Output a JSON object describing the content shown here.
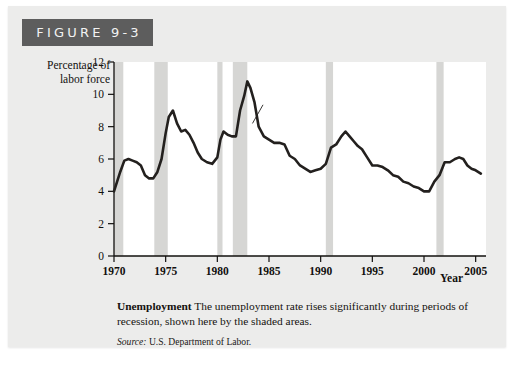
{
  "figure": {
    "badge_label": "FIGURE 9-3"
  },
  "caption": {
    "title": "Unemployment",
    "body": " The unemployment rate rises significantly during periods of recession, shown here by the shaded areas.",
    "source_label": "Source:",
    "source_text": " U.S. Department of Labor."
  },
  "axes": {
    "y_title": "Percentage of labor force",
    "x_title": "Year"
  },
  "annotation": {
    "series_label": "Unemployment rate"
  },
  "colors": {
    "badge_background": "#5d5d5d",
    "badge_text": "#f2f2f2",
    "page_background": "#ececeb",
    "plot_background": "#ffffff",
    "line": "#23201e",
    "recession_band": "#d6d6d4",
    "axis": "#12100e"
  },
  "chart_data": {
    "type": "line",
    "title": "Unemployment",
    "xlabel": "Year",
    "ylabel": "Percentage of labor force",
    "xlim": [
      1970,
      2006
    ],
    "ylim": [
      0,
      12
    ],
    "ytick_values": [
      0,
      2,
      4,
      6,
      8,
      10,
      12
    ],
    "xtick_values": [
      1970,
      1975,
      1980,
      1985,
      1990,
      1995,
      2000,
      2005
    ],
    "grid": false,
    "legend": "none",
    "series": [
      {
        "name": "Unemployment rate",
        "x": [
          1970.0,
          1970.3,
          1970.6,
          1971.0,
          1971.4,
          1971.8,
          1972.2,
          1972.6,
          1973.0,
          1973.4,
          1973.8,
          1974.2,
          1974.6,
          1975.0,
          1975.3,
          1975.7,
          1976.1,
          1976.5,
          1976.9,
          1977.3,
          1977.7,
          1978.1,
          1978.5,
          1979.0,
          1979.5,
          1980.0,
          1980.3,
          1980.6,
          1981.0,
          1981.4,
          1981.8,
          1982.2,
          1982.6,
          1982.9,
          1983.2,
          1983.6,
          1984.0,
          1984.5,
          1985.0,
          1985.5,
          1986.0,
          1986.5,
          1987.0,
          1987.5,
          1988.0,
          1988.5,
          1989.0,
          1989.5,
          1990.0,
          1990.5,
          1991.0,
          1991.5,
          1992.0,
          1992.4,
          1992.8,
          1993.2,
          1993.6,
          1994.0,
          1994.5,
          1995.0,
          1995.5,
          1996.0,
          1996.5,
          1997.0,
          1997.5,
          1998.0,
          1998.5,
          1999.0,
          1999.5,
          2000.0,
          2000.5,
          2001.0,
          2001.5,
          2002.0,
          2002.5,
          2003.0,
          2003.4,
          2003.8,
          2004.2,
          2004.6,
          2005.0,
          2005.5
        ],
        "y": [
          4.0,
          4.6,
          5.2,
          5.9,
          6.0,
          5.9,
          5.8,
          5.6,
          5.0,
          4.8,
          4.8,
          5.2,
          6.0,
          7.6,
          8.6,
          9.0,
          8.2,
          7.7,
          7.8,
          7.5,
          7.0,
          6.4,
          6.0,
          5.8,
          5.7,
          6.1,
          7.2,
          7.7,
          7.5,
          7.4,
          7.4,
          9.0,
          9.9,
          10.8,
          10.4,
          9.5,
          8.0,
          7.4,
          7.2,
          7.0,
          7.0,
          6.9,
          6.2,
          6.0,
          5.6,
          5.4,
          5.2,
          5.3,
          5.4,
          5.7,
          6.7,
          6.9,
          7.4,
          7.7,
          7.4,
          7.1,
          6.8,
          6.6,
          6.1,
          5.6,
          5.6,
          5.5,
          5.3,
          5.0,
          4.9,
          4.6,
          4.5,
          4.3,
          4.2,
          4.0,
          4.0,
          4.6,
          5.0,
          5.8,
          5.8,
          6.0,
          6.1,
          6.0,
          5.6,
          5.4,
          5.3,
          5.1
        ]
      }
    ],
    "recession_bands": [
      {
        "label": "1969-1970 recession",
        "start": 1970.0,
        "end": 1970.9
      },
      {
        "label": "1973-1975 recession",
        "start": 1973.9,
        "end": 1975.2
      },
      {
        "label": "1980 recession",
        "start": 1980.0,
        "end": 1980.5
      },
      {
        "label": "1981-1982 recession",
        "start": 1981.5,
        "end": 1982.9
      },
      {
        "label": "1990-1991 recession",
        "start": 1990.5,
        "end": 1991.2
      },
      {
        "label": "2001 recession",
        "start": 2001.2,
        "end": 2001.9
      }
    ],
    "annotations": [
      {
        "text": "Unemployment rate",
        "x": 1985.0,
        "y": 9.6,
        "points_to_x": 1983.4,
        "points_to_y": 8.2
      }
    ]
  }
}
